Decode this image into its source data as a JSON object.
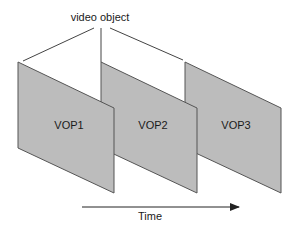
{
  "diagram": {
    "title": "video object",
    "time_label": "Time",
    "colors": {
      "plane_fill": "#bcbcbc",
      "plane_stroke": "#555555",
      "line": "#444444",
      "text": "#1a1a1a"
    },
    "planes": [
      {
        "label": "VOP1"
      },
      {
        "label": "VOP2"
      },
      {
        "label": "VOP3"
      }
    ]
  }
}
